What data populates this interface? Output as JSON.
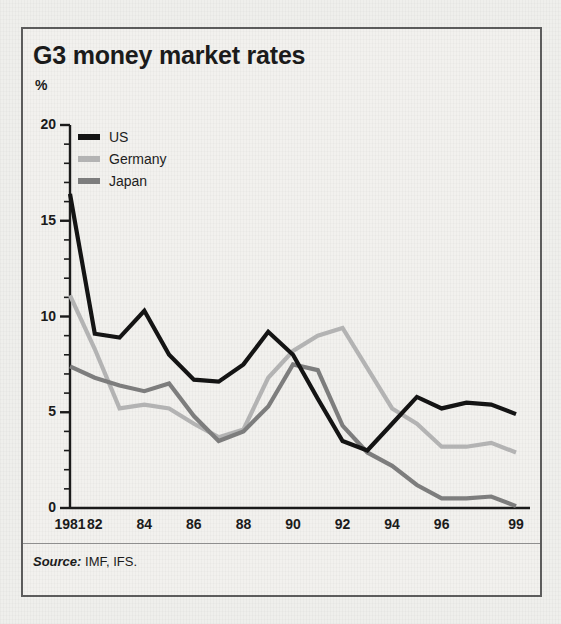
{
  "figure": {
    "title": "G3 money market rates",
    "y_axis_unit": "%",
    "source_prefix": "Source:",
    "source_text": "IMF, IFS.",
    "panel_background": "#f2f1ee",
    "border_color": "#5d5d5d"
  },
  "legend": {
    "position": "top-left-inside",
    "items": [
      {
        "label": "US",
        "color": "#141414"
      },
      {
        "label": "Germany",
        "color": "#b3b3b3"
      },
      {
        "label": "Japan",
        "color": "#7d7d7d"
      }
    ]
  },
  "chart_data": {
    "type": "line",
    "title": "G3 money market rates",
    "subtitle": "",
    "xlabel": "",
    "ylabel": "%",
    "ylim": [
      0,
      20
    ],
    "xlim": [
      1981,
      1999
    ],
    "grid": false,
    "y_ticks": [
      0,
      5,
      10,
      15,
      20
    ],
    "y_tick_labels": [
      "0",
      "5",
      "10",
      "15",
      "20"
    ],
    "y_minor_tick_step": 1,
    "x_ticks": [
      1981,
      1982,
      1984,
      1986,
      1988,
      1990,
      1992,
      1994,
      1996,
      1999
    ],
    "x_tick_labels": [
      "1981",
      "82",
      "84",
      "86",
      "88",
      "90",
      "92",
      "94",
      "96",
      "99"
    ],
    "x": [
      1981,
      1982,
      1983,
      1984,
      1985,
      1986,
      1987,
      1988,
      1989,
      1990,
      1991,
      1992,
      1993,
      1994,
      1995,
      1996,
      1997,
      1998,
      1999
    ],
    "legend_position": "upper left",
    "annotations": [],
    "series": [
      {
        "name": "US",
        "color": "#141414",
        "values": [
          16.4,
          9.1,
          8.9,
          10.3,
          8.0,
          6.7,
          6.6,
          7.5,
          9.2,
          8.0,
          5.7,
          3.5,
          3.0,
          4.4,
          5.8,
          5.2,
          5.5,
          5.4,
          4.9
        ]
      },
      {
        "name": "Germany",
        "color": "#b3b3b3",
        "values": [
          11.1,
          8.3,
          5.2,
          5.4,
          5.2,
          4.4,
          3.7,
          4.1,
          6.8,
          8.2,
          9.0,
          9.4,
          7.3,
          5.2,
          4.4,
          3.2,
          3.2,
          3.4,
          2.9
        ]
      },
      {
        "name": "Japan",
        "color": "#7d7d7d",
        "values": [
          7.4,
          6.8,
          6.4,
          6.1,
          6.5,
          4.8,
          3.5,
          4.0,
          5.3,
          7.5,
          7.2,
          4.3,
          2.9,
          2.2,
          1.2,
          0.5,
          0.5,
          0.6,
          0.1
        ]
      }
    ]
  }
}
